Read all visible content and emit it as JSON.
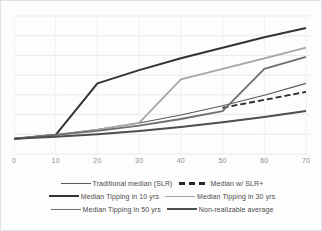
{
  "chart_data": {
    "type": "line",
    "title": "",
    "xlabel": "",
    "ylabel": "",
    "xticks": [
      "0",
      "10",
      "20",
      "30",
      "40",
      "50",
      "60",
      "70"
    ],
    "xlim": [
      0,
      70
    ],
    "ylim": [
      0,
      1
    ],
    "yticks_visible": false,
    "grid": "horizontal",
    "legend_position": "bottom",
    "series": [
      {
        "name": "Traditional median (SLR)",
        "color": "#595959",
        "width": 1.1,
        "style": "solid",
        "x": [
          0,
          10,
          20,
          30,
          40,
          50,
          60,
          70
        ],
        "values": [
          0.1,
          0.13,
          0.17,
          0.22,
          0.28,
          0.35,
          0.43,
          0.52
        ]
      },
      {
        "name": "Median w/ SLR+",
        "color": "#262626",
        "width": 1.8,
        "style": "dashed",
        "x": [
          50,
          55,
          60,
          65,
          70
        ],
        "values": [
          0.335,
          0.365,
          0.395,
          0.425,
          0.455
        ]
      },
      {
        "name": "Median Tipping in 10 yrs",
        "color": "#333333",
        "width": 2.0,
        "style": "solid",
        "x": [
          0,
          10,
          20,
          30,
          40,
          50,
          60,
          70
        ],
        "values": [
          0.1,
          0.13,
          0.52,
          0.62,
          0.71,
          0.79,
          0.87,
          0.94
        ]
      },
      {
        "name": "Median Tipping in 30 yrs",
        "color": "#a6a6a6",
        "width": 1.8,
        "style": "solid",
        "x": [
          0,
          10,
          20,
          30,
          40,
          50,
          60,
          70
        ],
        "values": [
          0.1,
          0.13,
          0.17,
          0.22,
          0.55,
          0.63,
          0.71,
          0.79
        ]
      },
      {
        "name": "Median Tipping in 50 yrs",
        "color": "#6e6e6e",
        "width": 1.8,
        "style": "solid",
        "x": [
          0,
          10,
          20,
          30,
          40,
          50,
          60,
          70
        ],
        "values": [
          0.1,
          0.13,
          0.16,
          0.2,
          0.25,
          0.31,
          0.63,
          0.72
        ]
      },
      {
        "name": "Non-realizable average",
        "color": "#4d4d4d",
        "width": 2.0,
        "style": "solid",
        "x": [
          0,
          10,
          20,
          30,
          40,
          50,
          60,
          70
        ],
        "values": [
          0.1,
          0.115,
          0.135,
          0.16,
          0.19,
          0.225,
          0.265,
          0.31
        ]
      }
    ]
  },
  "legend": {
    "rows": [
      [
        {
          "label": "Traditional median (SLR)",
          "series": 0
        },
        {
          "label": "Median w/ SLR+",
          "series": 1
        }
      ],
      [
        {
          "label": "Median Tipping in 10 yrs",
          "series": 2
        },
        {
          "label": "Median Tipping in 30 yrs",
          "series": 3
        }
      ],
      [
        {
          "label": "Median Tipping in 50 yrs",
          "series": 4
        },
        {
          "label": "Non-realizable average",
          "series": 5
        }
      ]
    ]
  }
}
